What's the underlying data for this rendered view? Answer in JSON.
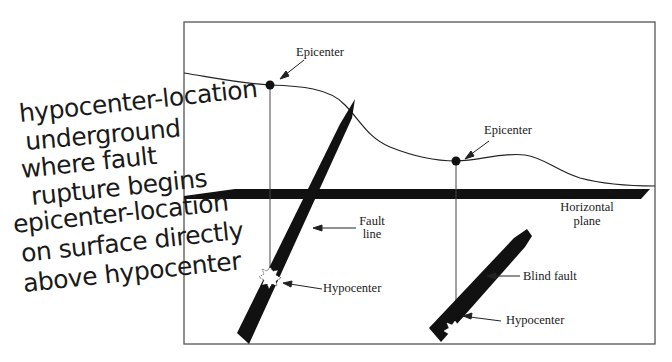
{
  "diagram": {
    "labels": {
      "epicenter_1": "Epicenter",
      "epicenter_2": "Epicenter",
      "horizontal_plane_line1": "Horizontal",
      "horizontal_plane_line2": "plane",
      "fault_line_line1": "Fault",
      "fault_line_line2": "line",
      "hypocenter_1": "Hypocenter",
      "hypocenter_2": "Hypocenter",
      "blind_fault": "Blind fault"
    },
    "handwritten_notes": [
      "hypocenter-location",
      "underground",
      "where fault",
      "rupture begins",
      "epicenter-location",
      "on surface directly",
      "above hypocenter"
    ],
    "colors": {
      "ink": "#111111",
      "frame": "#555555",
      "background": "#ffffff"
    }
  }
}
